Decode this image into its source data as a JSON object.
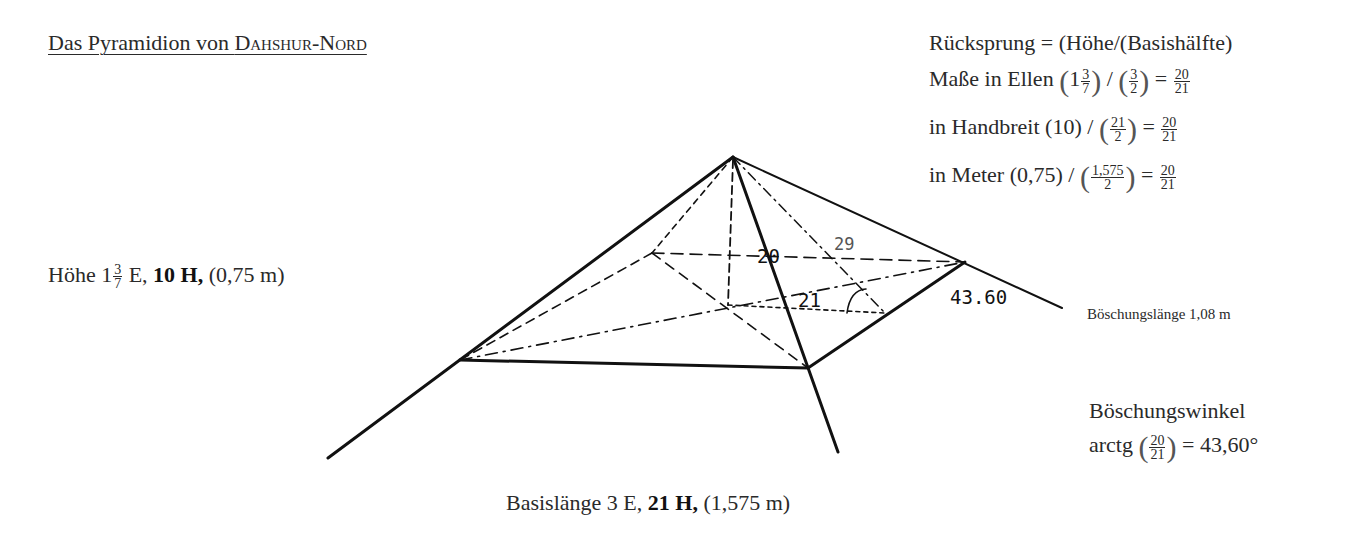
{
  "title": {
    "prefix": "Das Pyramidion von ",
    "name_sc": "Dahshur-Nord"
  },
  "formulas": {
    "ruecksprung": "Rücksprung = (Höhe/(Basishälfte)",
    "ellen": {
      "label": "Maße in Ellen",
      "height_whole": "1",
      "height_num": "3",
      "height_den": "7",
      "half_num": "3",
      "half_den": "2",
      "result_num": "20",
      "result_den": "21"
    },
    "handbreit": {
      "label": "in Handbreit",
      "height": "(10)",
      "half_num": "21",
      "half_den": "2",
      "result_num": "20",
      "result_den": "21"
    },
    "meter": {
      "label": "in Meter",
      "height": "(0,75)",
      "half_num": "1,575",
      "half_den": "2",
      "result_num": "20",
      "result_den": "21"
    }
  },
  "height_label": {
    "prefix": "Höhe 1",
    "frac_num": "3",
    "frac_den": "7",
    "unit": " E, ",
    "bold": "10 H,",
    "meters": " (0,75 m)"
  },
  "base_label": {
    "prefix": "Basislänge 3 E, ",
    "bold": "21 H,",
    "meters": " (1,575 m)"
  },
  "slope_length": "Böschungslänge 1,08 m",
  "slope_angle": {
    "title": "Böschungswinkel",
    "prefix": "arctg",
    "num": "20",
    "den": "21",
    "result": "= 43,60°"
  },
  "diagram_labels": {
    "height": "20",
    "half_base": "21",
    "apothem": "29",
    "angle": "43.60"
  }
}
